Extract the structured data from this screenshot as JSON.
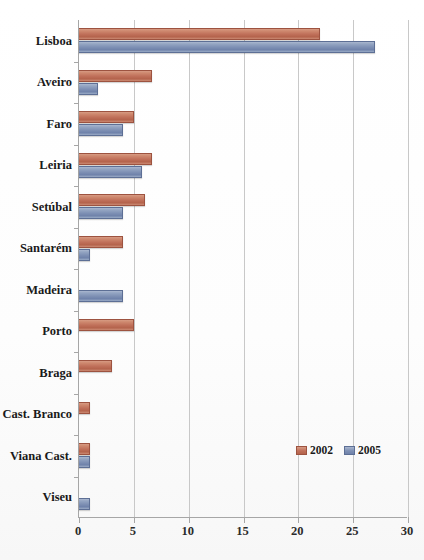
{
  "chart_data": {
    "type": "bar",
    "orientation": "horizontal",
    "title": "",
    "xlabel": "",
    "ylabel": "",
    "xlim": [
      0,
      30
    ],
    "xticks": [
      0,
      5,
      10,
      15,
      20,
      25,
      30
    ],
    "xtick_labels": [
      "0",
      "5",
      "10",
      "15",
      "20",
      "25",
      "30"
    ],
    "grid": true,
    "legend_position": "inside-lower-right",
    "categories": [
      "Lisboa",
      "Aveiro",
      "Faro",
      "Leiria",
      "Setúbal",
      "Santarém",
      "Madeira",
      "Porto",
      "Braga",
      "Cast. Branco",
      "Viana Cast.",
      "Viseu"
    ],
    "series": [
      {
        "name": "2002",
        "color": "#c0705a",
        "values": [
          22,
          6.7,
          5,
          6.7,
          6,
          4,
          0,
          5,
          3,
          1,
          1,
          0
        ]
      },
      {
        "name": "2005",
        "color": "#7e90b4",
        "values": [
          27,
          1.7,
          4,
          5.7,
          4,
          1,
          4,
          0,
          0,
          0,
          1,
          1
        ]
      }
    ]
  },
  "legend": {
    "items": [
      {
        "label": "2002",
        "swatch": "legend-swatch-2002"
      },
      {
        "label": "2005",
        "swatch": "legend-swatch-2005"
      }
    ]
  },
  "colors": {
    "series_2002": "#c0705a",
    "series_2005": "#7e90b4",
    "axis": "#a6a6a6",
    "gridline": "#c8c8c8",
    "text": "#1a1a1a",
    "background": "#ffffff"
  }
}
